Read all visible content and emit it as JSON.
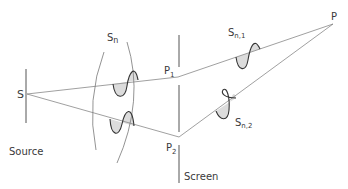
{
  "diagram": {
    "labels": {
      "source_point": "S",
      "source": "Source",
      "wavefront": "S",
      "wavefront_sub": "n",
      "slit1": "P",
      "slit1_sub": "1",
      "slit2": "P",
      "slit2_sub": "2",
      "screen": "Screen",
      "point": "P",
      "wave1": "S",
      "wave1_sub": "n,1",
      "wave2": "S",
      "wave2_sub": "n,2"
    },
    "nodes": [
      {
        "id": "S",
        "x": 27,
        "y": 94
      },
      {
        "id": "P1",
        "x": 178,
        "y": 77
      },
      {
        "id": "P2",
        "x": 179,
        "y": 137
      },
      {
        "id": "P",
        "x": 333,
        "y": 24
      }
    ],
    "edges": [
      {
        "from": "S",
        "to": "P1"
      },
      {
        "from": "S",
        "to": "P2"
      },
      {
        "from": "P1",
        "to": "P"
      },
      {
        "from": "P2",
        "to": "P"
      }
    ],
    "colors": {
      "line": "#555555",
      "wave": "#333333",
      "hatch": "#777777"
    }
  }
}
